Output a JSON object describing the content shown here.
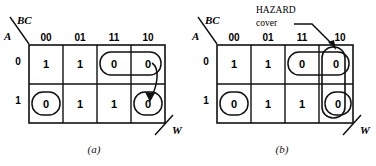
{
  "figures": [
    {
      "id": "a",
      "caption": "(a)",
      "kmap": {
        "row_var": "A",
        "col_var": "BC",
        "col_headers": [
          "00",
          "01",
          "11",
          "10"
        ],
        "row_headers": [
          "0",
          "1"
        ],
        "cells": [
          [
            "1",
            "1",
            "0",
            "0"
          ],
          [
            "0",
            "1",
            "1",
            "0"
          ]
        ],
        "output_label": "W",
        "loops": [
          {
            "name": "loop-row0-cols-11-10",
            "row": 0,
            "col_start": 2,
            "col_end": 3
          },
          {
            "name": "loop-row1-col-00",
            "row": 1,
            "col_start": 0,
            "col_end": 0
          },
          {
            "name": "loop-row1-col-10",
            "row": 1,
            "col_start": 3,
            "col_end": 3
          }
        ],
        "hazard_arrow": {
          "name": "hazard-transition-arrow",
          "from_cell": {
            "row": 0,
            "col": 3
          },
          "to_cell": {
            "row": 1,
            "col": 3
          }
        }
      }
    },
    {
      "id": "b",
      "caption": "(b)",
      "annotation": {
        "name": "hazard-cover-annotation",
        "line1": "HAZARD",
        "line2": "cover"
      },
      "kmap": {
        "row_var": "A",
        "col_var": "BC",
        "col_headers": [
          "00",
          "01",
          "11",
          "10"
        ],
        "row_headers": [
          "0",
          "1"
        ],
        "cells": [
          [
            "1",
            "1",
            "0",
            "0"
          ],
          [
            "0",
            "1",
            "1",
            "0"
          ]
        ],
        "output_label": "W",
        "loops": [
          {
            "name": "loop-row0-cols-11-10",
            "row": 0,
            "col_start": 2,
            "col_end": 3
          },
          {
            "name": "loop-row1-col-00",
            "row": 1,
            "col_start": 0,
            "col_end": 0
          },
          {
            "name": "loop-row0-col-10",
            "row": 0,
            "col_start": 3,
            "col_end": 3
          },
          {
            "name": "loop-row1-col-10",
            "row": 1,
            "col_start": 3,
            "col_end": 3
          },
          {
            "name": "hazard-cover-loop-col-10",
            "row": 0,
            "col_start": 3,
            "col_end": 3,
            "spans_both_rows": true
          }
        ]
      }
    }
  ],
  "colors": {
    "ink": "#111111",
    "background": "#ffffff"
  }
}
